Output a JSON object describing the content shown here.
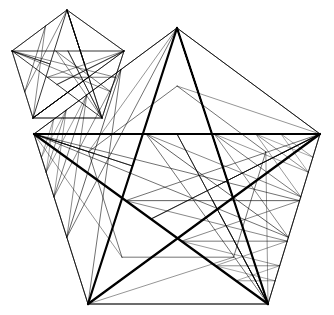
{
  "diagram": {
    "background": "#ffffff",
    "stroke_color": "#000000",
    "small_star": {
      "points": [
        [
          67,
          10
        ],
        [
          124,
          51
        ],
        [
          102,
          118
        ],
        [
          33,
          118
        ],
        [
          12,
          51
        ]
      ],
      "outline_width": 0.8,
      "depth": 1,
      "inner_width": 0.6
    },
    "large_star": {
      "points": [
        [
          177,
          28
        ],
        [
          320,
          134
        ],
        [
          268,
          304
        ],
        [
          88,
          304
        ],
        [
          34,
          134
        ]
      ],
      "outline_width": 2.2,
      "depth": 4,
      "inner_width": 0.7
    }
  }
}
